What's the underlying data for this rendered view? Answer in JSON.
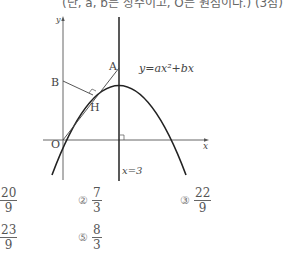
{
  "header": {
    "text": "(단, a, b는 상수이고, O는 원점이다.) (3점)"
  },
  "figure": {
    "axis_labels": {
      "x": "x",
      "y": "y"
    },
    "points": {
      "A": "A",
      "B": "B",
      "H": "H",
      "O": "O"
    },
    "curve_label": "y=ax²+bx",
    "line_label": "x=3"
  },
  "options": [
    {
      "num": "①",
      "numerator": "20",
      "denominator": "9"
    },
    {
      "num": "②",
      "numerator": "7",
      "denominator": "3"
    },
    {
      "num": "③",
      "numerator": "22",
      "denominator": "9"
    },
    {
      "num": "④",
      "numerator": "23",
      "denominator": "9"
    },
    {
      "num": "⑤",
      "numerator": "8",
      "denominator": "3"
    }
  ]
}
